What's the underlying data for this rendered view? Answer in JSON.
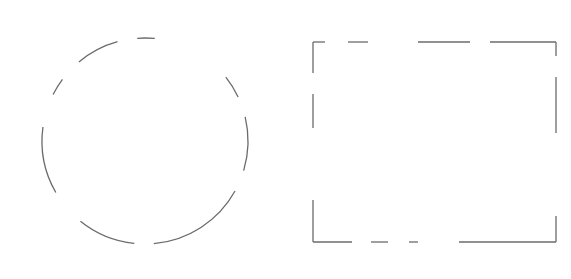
{
  "canvas": {
    "width": 571,
    "height": 279,
    "background": "#ffffff"
  },
  "style": {
    "stroke_color": "#6b6b6b",
    "stroke_width": 1.3
  },
  "shapes": [
    {
      "name": "dashed-circle",
      "type": "circle",
      "center": [
        145,
        141
      ],
      "radius": 103,
      "segments": [
        [
          [
            137,
            35
          ],
          [
            155,
            36
          ]
        ],
        [
          [
            78,
            61
          ],
          [
            117,
            40
          ]
        ],
        [
          [
            52,
            94
          ],
          [
            62,
            79
          ]
        ],
        [
          [
            43,
            127
          ],
          [
            55,
            193
          ]
        ],
        [
          [
            79,
            223
          ],
          [
            134,
            246
          ]
        ],
        [
          [
            154,
            246
          ],
          [
            235,
            191
          ]
        ],
        [
          [
            245,
            117
          ],
          [
            245,
            171
          ]
        ],
        [
          [
            226,
            77
          ],
          [
            238,
            97
          ]
        ]
      ]
    },
    {
      "name": "dashed-rectangle",
      "type": "rectangle",
      "x": 313,
      "y": 42,
      "width": 243,
      "height": 200,
      "segments": [
        [
          [
            313,
            42
          ],
          [
            325,
            42
          ]
        ],
        [
          [
            348,
            42
          ],
          [
            368,
            42
          ]
        ],
        [
          [
            418,
            42
          ],
          [
            470,
            42
          ]
        ],
        [
          [
            490,
            42
          ],
          [
            556,
            42
          ]
        ],
        [
          [
            313,
            242
          ],
          [
            352,
            242
          ]
        ],
        [
          [
            371,
            242
          ],
          [
            388,
            242
          ]
        ],
        [
          [
            409,
            242
          ],
          [
            418,
            242
          ]
        ],
        [
          [
            459,
            242
          ],
          [
            556,
            242
          ]
        ],
        [
          [
            313,
            42
          ],
          [
            313,
            73
          ]
        ],
        [
          [
            313,
            94
          ],
          [
            313,
            128
          ]
        ],
        [
          [
            313,
            200
          ],
          [
            313,
            242
          ]
        ],
        [
          [
            556,
            42
          ],
          [
            556,
            56
          ]
        ],
        [
          [
            556,
            77
          ],
          [
            556,
            133
          ]
        ],
        [
          [
            556,
            216
          ],
          [
            556,
            242
          ]
        ]
      ]
    }
  ]
}
